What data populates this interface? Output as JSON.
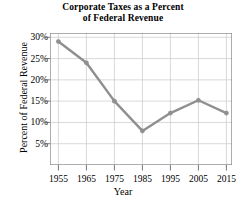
{
  "chart_data": {
    "type": "line",
    "title": "Corporate Taxes as a Percent of Federal Revenue",
    "title_lines": [
      "Corporate Taxes as a Percent",
      "of Federal Revenue"
    ],
    "xlabel": "Year",
    "ylabel": "Percent of Federal Revenue",
    "categories": [
      1955,
      1965,
      1975,
      1985,
      1995,
      2005,
      2015
    ],
    "x": [
      1955,
      1965,
      1975,
      1985,
      1995,
      2005,
      2015
    ],
    "values": [
      29,
      24,
      15,
      8,
      12.2,
      15.2,
      12.2
    ],
    "xtick_labels": [
      "1955",
      "1965",
      "1975",
      "1985",
      "1995",
      "2005",
      "2015"
    ],
    "ytick_labels": [
      "5%",
      "10%",
      "15%",
      "20%",
      "25%",
      "30%"
    ],
    "ytick_values": [
      5,
      10,
      15,
      20,
      25,
      30
    ],
    "xlim": [
      1952,
      2017
    ],
    "ylim": [
      0,
      31
    ],
    "grid": true,
    "legend": null,
    "line_color": "#8f8f8f",
    "marker_color": "#8f8f8f",
    "grid_color": "#c8c8c8",
    "axis_color": "#555555",
    "background": "#ffffff"
  }
}
